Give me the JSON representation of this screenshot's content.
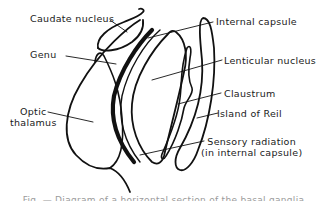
{
  "figure": {
    "type": "anatomical-line-diagram",
    "stroke_color": "#111111",
    "background": "#ffffff",
    "labels": {
      "caudate_nucleus": "Caudate nucleus",
      "genu": "Genu",
      "optic_thalamus_line1": "Optic",
      "optic_thalamus_line2": "thalamus",
      "internal_capsule": "Internal capsule",
      "lenticular_nucleus": "Lenticular nucleus",
      "claustrum": "Claustrum",
      "island_of_reil": "Island of Reil",
      "sensory_radiation_line1": "Sensory radiation",
      "sensory_radiation_line2": "(in internal capsule)"
    },
    "caption": "Fig. — Diagram of a horizontal section of the basal ganglia"
  }
}
